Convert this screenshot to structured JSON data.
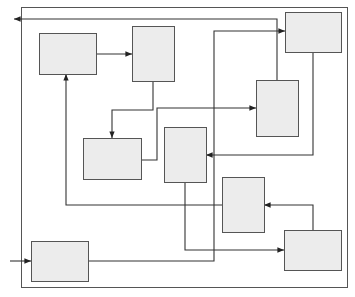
{
  "diagram": {
    "type": "block-flow",
    "colors": {
      "box_fill": "#ececec",
      "box_stroke": "#555555",
      "line": "#333333",
      "background": "#ffffff"
    },
    "frame": {
      "x": 21,
      "y": 7,
      "w": 326,
      "h": 280
    },
    "boxes": [
      {
        "id": "A",
        "x": 39,
        "y": 33,
        "w": 57,
        "h": 41,
        "label": ""
      },
      {
        "id": "B",
        "x": 132,
        "y": 26,
        "w": 42,
        "h": 55,
        "label": ""
      },
      {
        "id": "C",
        "x": 285,
        "y": 12,
        "w": 56,
        "h": 40,
        "label": ""
      },
      {
        "id": "D",
        "x": 256,
        "y": 80,
        "w": 42,
        "h": 56,
        "label": ""
      },
      {
        "id": "E",
        "x": 83,
        "y": 138,
        "w": 58,
        "h": 41,
        "label": ""
      },
      {
        "id": "F",
        "x": 164,
        "y": 127,
        "w": 42,
        "h": 55,
        "label": ""
      },
      {
        "id": "G",
        "x": 222,
        "y": 177,
        "w": 42,
        "h": 55,
        "label": ""
      },
      {
        "id": "H",
        "x": 31,
        "y": 241,
        "w": 57,
        "h": 40,
        "label": ""
      },
      {
        "id": "I",
        "x": 284,
        "y": 230,
        "w": 57,
        "h": 40,
        "label": ""
      }
    ],
    "connections": [
      {
        "from": "D",
        "to": "output",
        "points": "277,80 277,19 14,19"
      },
      {
        "from": "A",
        "to": "B",
        "points": "96,54 132,54"
      },
      {
        "from": "B",
        "to": "E",
        "points": "153,81 153,110 112,110 112,138"
      },
      {
        "from": "E",
        "to": "D",
        "points": "141,160 157,160 157,108 256,108"
      },
      {
        "from": "C",
        "to": "F",
        "points": "313,52 313,155 206,155"
      },
      {
        "from": "G",
        "to": "A",
        "points": "222,205 66,205 66,74"
      },
      {
        "from": "I",
        "to": "G",
        "points": "313,230 313,205 264,205"
      },
      {
        "from": "F",
        "to": "I",
        "points": "185,182 185,250 284,250"
      },
      {
        "from": "H",
        "to": "C",
        "points": "88,261 214,261 214,31 285,31"
      },
      {
        "from": "input",
        "to": "H",
        "points": "10,261 31,261"
      }
    ]
  }
}
